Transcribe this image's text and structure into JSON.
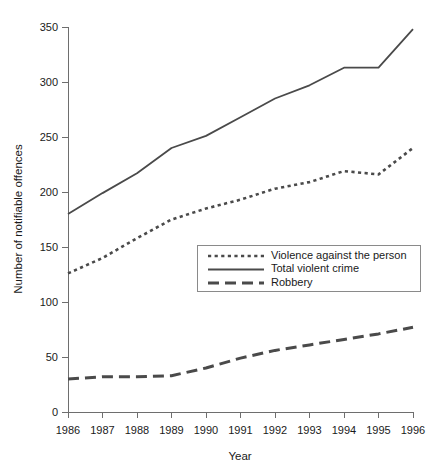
{
  "chart_data": {
    "type": "line",
    "title": "",
    "xlabel": "Year",
    "ylabel": "Number of notifiable offences",
    "x": [
      1986,
      1987,
      1988,
      1989,
      1990,
      1991,
      1992,
      1993,
      1994,
      1995,
      1996
    ],
    "categories": [
      "1986",
      "1987",
      "1988",
      "1989",
      "1990",
      "1991",
      "1992",
      "1993",
      "1994",
      "1995",
      "1996"
    ],
    "xlim": [
      1986,
      1996
    ],
    "ylim": [
      0,
      350
    ],
    "yticks": [
      0,
      50,
      100,
      150,
      200,
      250,
      300,
      350
    ],
    "ytick_labels": [
      "0",
      "50",
      "100",
      "150",
      "200",
      "250",
      "300",
      "350"
    ],
    "xticks": [
      1986,
      1987,
      1988,
      1989,
      1990,
      1991,
      1992,
      1993,
      1994,
      1995,
      1996
    ],
    "xtick_labels": [
      "1986",
      "1987",
      "1988",
      "1989",
      "1990",
      "1991",
      "1992",
      "1993",
      "1994",
      "1995",
      "1996"
    ],
    "grid": false,
    "legend_position": "center",
    "series": [
      {
        "name": "Violence against the person",
        "style": "dotted",
        "color": "#4a4a4a",
        "values": [
          126,
          140,
          158,
          175,
          185,
          193,
          203,
          209,
          219,
          216,
          240
        ]
      },
      {
        "name": "Total violent crime",
        "style": "solid",
        "color": "#4a4a4a",
        "values": [
          180,
          199,
          217,
          240,
          251,
          268,
          285,
          297,
          313,
          313,
          348
        ]
      },
      {
        "name": "Robbery",
        "style": "dashed",
        "color": "#4a4a4a",
        "values": [
          30,
          32,
          32,
          33,
          40,
          49,
          56,
          61,
          66,
          71,
          77
        ]
      }
    ]
  },
  "legend": {
    "entries": [
      {
        "label": "Violence against the person",
        "style": "dotted"
      },
      {
        "label": "Total violent crime",
        "style": "solid"
      },
      {
        "label": "Robbery",
        "style": "dashed"
      }
    ]
  },
  "axes": {
    "x_title": "Year",
    "y_title": "Number of notifiable offences"
  }
}
